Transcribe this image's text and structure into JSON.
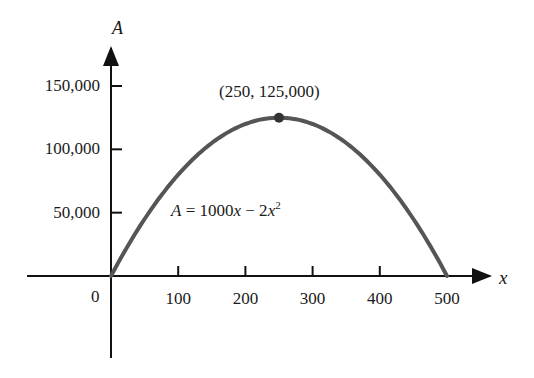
{
  "chart_data": {
    "type": "line",
    "title": "",
    "xlabel": "x",
    "ylabel": "A",
    "equation": {
      "lhs": "A",
      "rhs": "1000x − 2x",
      "exponent": "2"
    },
    "xlim": [
      0,
      500
    ],
    "ylim": [
      0,
      150000
    ],
    "x_ticks": [
      100,
      200,
      300,
      400,
      500
    ],
    "x_tick_labels": [
      "100",
      "200",
      "300",
      "400",
      "500"
    ],
    "y_ticks": [
      50000,
      100000,
      150000
    ],
    "y_tick_labels": [
      "50,000",
      "100,000",
      "150,000"
    ],
    "origin_label": "0",
    "grid": false,
    "legend": "none",
    "series": [
      {
        "name": "A = 1000x - 2x^2",
        "x": [
          0,
          50,
          100,
          150,
          200,
          250,
          300,
          350,
          400,
          450,
          500
        ],
        "values": [
          0,
          45000,
          80000,
          105000,
          120000,
          125000,
          120000,
          105000,
          80000,
          45000,
          0
        ]
      }
    ],
    "annotations": [
      {
        "x": 250,
        "y": 125000,
        "text": "(250, 125,000)",
        "marker": "dot"
      }
    ]
  },
  "labels": {
    "axis_a": "A",
    "axis_x": "x",
    "origin": "0",
    "peak": "(250, 125,000)",
    "formula_lhs": "A",
    "formula_mid": " = 1000",
    "formula_x1": "x",
    "formula_minus": " − 2",
    "formula_x2": "x",
    "formula_exp": "2"
  }
}
